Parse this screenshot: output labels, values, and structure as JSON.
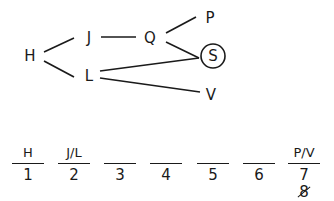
{
  "diagram": {
    "nodes": [
      {
        "id": "H",
        "label": "H",
        "x": 30,
        "y": 56
      },
      {
        "id": "J",
        "label": "J",
        "x": 89,
        "y": 38
      },
      {
        "id": "L",
        "label": "L",
        "x": 89,
        "y": 76
      },
      {
        "id": "Q",
        "label": "Q",
        "x": 150,
        "y": 38
      },
      {
        "id": "P",
        "label": "P",
        "x": 210,
        "y": 18
      },
      {
        "id": "S",
        "label": "S",
        "x": 213,
        "y": 56,
        "circled": true
      },
      {
        "id": "V",
        "label": "V",
        "x": 211,
        "y": 95
      }
    ],
    "edges": [
      [
        "H",
        "J"
      ],
      [
        "H",
        "L"
      ],
      [
        "J",
        "Q"
      ],
      [
        "Q",
        "P"
      ],
      [
        "Q",
        "S"
      ],
      [
        "L",
        "S"
      ],
      [
        "L",
        "V"
      ]
    ]
  },
  "slots": [
    {
      "label": "H",
      "number": "1"
    },
    {
      "label": "J/L",
      "number": "2"
    },
    {
      "label": "",
      "number": "3"
    },
    {
      "label": "",
      "number": "4"
    },
    {
      "label": "",
      "number": "5"
    },
    {
      "label": "",
      "number": "6"
    },
    {
      "label": "P/V",
      "number": "7",
      "crossed_out": "8"
    }
  ]
}
